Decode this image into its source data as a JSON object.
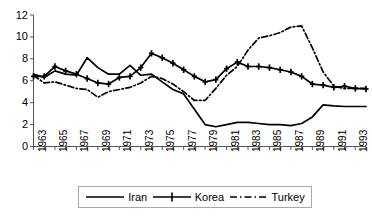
{
  "chart_data": {
    "type": "line",
    "title": "",
    "xlabel": "",
    "ylabel": "",
    "xlim": [
      1963,
      1994
    ],
    "ylim": [
      0,
      12
    ],
    "grid": false,
    "legend_position": "bottom",
    "x": [
      1963,
      1964,
      1965,
      1966,
      1967,
      1968,
      1969,
      1970,
      1971,
      1972,
      1973,
      1974,
      1975,
      1976,
      1977,
      1978,
      1979,
      1980,
      1981,
      1982,
      1983,
      1984,
      1985,
      1986,
      1987,
      1988,
      1989,
      1990,
      1991,
      1992,
      1993,
      1994
    ],
    "y_ticks": [
      0,
      2,
      4,
      6,
      8,
      10,
      12
    ],
    "x_tick_labels": [
      "1963",
      "1965",
      "1967",
      "1969",
      "1971",
      "1973",
      "1975",
      "1977",
      "1979",
      "1981",
      "1983",
      "1985",
      "1987",
      "1989",
      "1991",
      "1993"
    ],
    "series": [
      {
        "name": "Iran",
        "style": "solid",
        "marker": "none",
        "color": "#000000",
        "values": [
          6.6,
          6.3,
          6.9,
          6.6,
          6.5,
          8.1,
          7.2,
          6.6,
          6.6,
          7.4,
          6.5,
          6.6,
          5.9,
          5.2,
          4.8,
          3.4,
          2.0,
          1.8,
          2.0,
          2.2,
          2.2,
          2.1,
          2.0,
          2.0,
          1.9,
          2.1,
          2.7,
          3.8,
          3.7,
          3.65,
          3.65,
          3.65
        ]
      },
      {
        "name": "Korea",
        "style": "solid",
        "marker": "plus",
        "color": "#000000",
        "values": [
          6.4,
          6.4,
          7.3,
          6.9,
          6.6,
          6.2,
          5.8,
          5.7,
          6.3,
          6.4,
          7.2,
          8.5,
          8.1,
          7.6,
          7.0,
          6.4,
          5.9,
          6.1,
          7.1,
          7.7,
          7.3,
          7.3,
          7.2,
          7.0,
          6.8,
          6.4,
          5.7,
          5.6,
          5.4,
          5.5,
          5.3,
          5.25
        ]
      },
      {
        "name": "Turkey",
        "style": "dashdot",
        "marker": "none",
        "color": "#000000",
        "values": [
          6.5,
          5.8,
          5.9,
          5.6,
          5.3,
          5.2,
          4.5,
          5.0,
          5.2,
          5.4,
          5.8,
          6.4,
          6.2,
          5.7,
          5.0,
          4.2,
          4.2,
          5.3,
          6.5,
          7.3,
          8.8,
          9.9,
          10.1,
          10.4,
          10.9,
          11.0,
          9.0,
          6.8,
          5.5,
          5.3,
          5.3,
          5.3
        ]
      }
    ]
  },
  "legend": {
    "items": [
      {
        "label": "Iran"
      },
      {
        "label": "Korea"
      },
      {
        "label": "Turkey"
      }
    ]
  }
}
